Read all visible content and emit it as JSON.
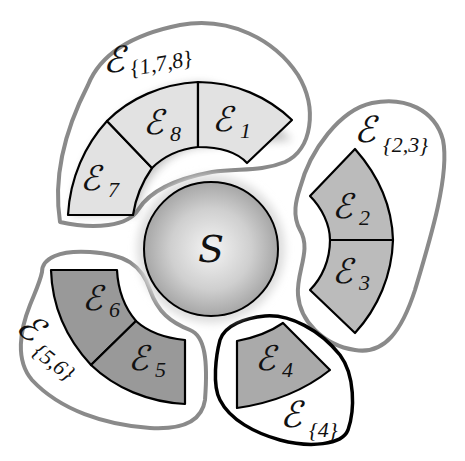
{
  "diagram": {
    "center": {
      "label": "S",
      "fill": "#c4c4c4"
    },
    "segments": [
      {
        "id": "1",
        "label": "ℰ",
        "sub": "1",
        "group": "{1,7,8}",
        "fill": "#e2e2e2"
      },
      {
        "id": "2",
        "label": "ℰ",
        "sub": "2",
        "group": "{2,3}",
        "fill": "#bbbbbb"
      },
      {
        "id": "3",
        "label": "ℰ",
        "sub": "3",
        "group": "{2,3}",
        "fill": "#bbbbbb"
      },
      {
        "id": "4",
        "label": "ℰ",
        "sub": "4",
        "group": "{4}",
        "fill": "#aaaaaa"
      },
      {
        "id": "5",
        "label": "ℰ",
        "sub": "5",
        "group": "{5,6}",
        "fill": "#999999"
      },
      {
        "id": "6",
        "label": "ℰ",
        "sub": "6",
        "group": "{5,6}",
        "fill": "#999999"
      },
      {
        "id": "7",
        "label": "ℰ",
        "sub": "7",
        "group": "{1,7,8}",
        "fill": "#e2e2e2"
      },
      {
        "id": "8",
        "label": "ℰ",
        "sub": "8",
        "group": "{1,7,8}",
        "fill": "#e2e2e2"
      }
    ],
    "groups": [
      {
        "id": "178",
        "label": "ℰ",
        "sub": "{1,7,8}",
        "outline": "#8a8a8a"
      },
      {
        "id": "23",
        "label": "ℰ",
        "sub": "{2,3}",
        "outline": "#8a8a8a"
      },
      {
        "id": "56",
        "label": "ℰ",
        "sub": "{5,6}",
        "outline": "#8a8a8a"
      },
      {
        "id": "4",
        "label": "ℰ",
        "sub": "{4}",
        "outline": "#000000"
      }
    ]
  }
}
